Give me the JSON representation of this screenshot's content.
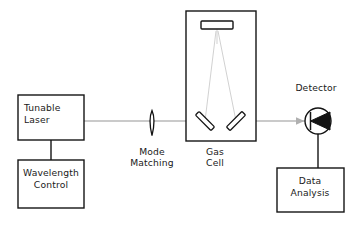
{
  "diagram": {
    "canvas": {
      "width": 361,
      "height": 225,
      "background": "#ffffff"
    },
    "colors": {
      "line": "#141414",
      "beam": "#b9b9b9",
      "ray": "#cccccc",
      "arrow": "#b0b0b0",
      "text": "#1a1a1a",
      "fill": "#ffffff"
    },
    "blocks": [
      {
        "id": "tunable-laser",
        "lines": [
          "Tunable",
          "Laser"
        ],
        "line1": "Tunable",
        "line2": "Laser",
        "x": 18,
        "y": 95,
        "w": 66,
        "h": 45
      },
      {
        "id": "wavelength-control",
        "lines": [
          "Wavelength",
          "Control"
        ],
        "line1": "Wavelength",
        "line2": "Control",
        "x": 18,
        "y": 160,
        "w": 66,
        "h": 48
      },
      {
        "id": "data-analysis",
        "lines": [
          "Data",
          "Analysis"
        ],
        "line1": "Data",
        "line2": "Analysis",
        "x": 277,
        "y": 168,
        "w": 67,
        "h": 44
      },
      {
        "id": "gas-cell-body",
        "lines": [],
        "x": 186,
        "y": 11,
        "w": 70,
        "h": 130
      }
    ],
    "labels": [
      {
        "id": "detector-label",
        "text": "Detector",
        "x": 316,
        "y": 91
      },
      {
        "id": "mode-matching-l1",
        "text": "Mode",
        "x": 152,
        "y": 155
      },
      {
        "id": "mode-matching-l2",
        "text": "Matching",
        "x": 152,
        "y": 166
      },
      {
        "id": "gas-cell-l1",
        "text": "Gas",
        "x": 215,
        "y": 155
      },
      {
        "id": "gas-cell-l2",
        "text": "Cell",
        "x": 215,
        "y": 166
      }
    ],
    "components": {
      "mode_matching_lens": {
        "name": "mode-matching-lens",
        "x": 152,
        "y_top": 110,
        "y_bottom": 136
      },
      "top_mirror": {
        "name": "gas-cell-top-mirror",
        "x": 201,
        "y": 21,
        "w": 32,
        "h": 8
      },
      "left_mirror": {
        "name": "gas-cell-left-mirror",
        "angle_deg": 45
      },
      "right_mirror": {
        "name": "gas-cell-right-mirror",
        "angle_deg": -45
      },
      "detector": {
        "name": "photodetector",
        "cx": 318,
        "cy": 121,
        "r": 13
      }
    },
    "beam": {
      "y": 121,
      "x_start": 84,
      "x_end": 305,
      "arrow_positions": [
        193,
        303
      ]
    },
    "wires": [
      {
        "name": "laser-to-wavelength-control",
        "x1": 51,
        "y1": 140,
        "x2": 51,
        "y2": 160
      },
      {
        "name": "detector-to-data-analysis",
        "x1": 318,
        "y1": 134,
        "x2": 318,
        "y2": 168
      }
    ]
  }
}
